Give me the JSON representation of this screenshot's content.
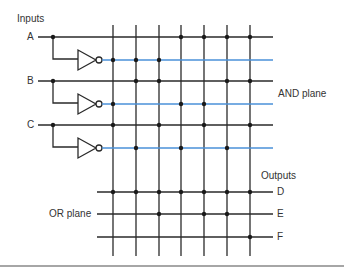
{
  "labels": {
    "inputs": "Inputs",
    "input_a": "A",
    "input_b": "B",
    "input_c": "C",
    "and_plane": "AND plane",
    "or_plane": "OR plane",
    "outputs": "Outputs",
    "output_d": "D",
    "output_e": "E",
    "output_f": "F"
  },
  "colors": {
    "line": "#2a2a2a",
    "complement_line": "#4a90d9",
    "dot": "#1a1a1a",
    "rule": "#888888"
  },
  "grid": {
    "product_term_columns": 7,
    "and_rows": [
      "A",
      "A'",
      "B",
      "B'",
      "C",
      "C'"
    ],
    "or_rows": [
      "D",
      "E",
      "F"
    ],
    "and_connections": {
      "A": [
        4,
        5,
        6,
        7
      ],
      "A'": [
        1,
        2,
        3
      ],
      "B": [
        2,
        3,
        6,
        7
      ],
      "B'": [
        1,
        4,
        5
      ],
      "C": [
        1,
        3,
        5,
        7
      ],
      "C'": [
        2,
        4,
        6
      ]
    },
    "or_connections": {
      "D": [
        1,
        2,
        3,
        4,
        5,
        6,
        7
      ],
      "E": [
        3,
        5,
        6
      ],
      "F": [
        7
      ]
    }
  }
}
